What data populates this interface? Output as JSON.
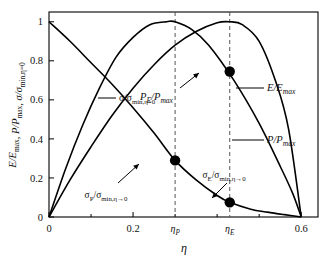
{
  "chart_data": {
    "type": "line",
    "title": "",
    "xlabel": "η",
    "ylabel": "E/E_max, P/P_max, σ/σ_min,η=0",
    "xlim": [
      0,
      0.64
    ],
    "ylim": [
      0,
      1.05
    ],
    "grid": false,
    "legend_position": "inline-labels",
    "x_ticks": [
      "0",
      "0.2",
      "ηP",
      "ηE",
      "0.6"
    ],
    "x_tick_values": [
      0,
      0.2,
      0.3,
      0.43,
      0.6
    ],
    "y_ticks": [
      "0",
      "0.2",
      "0.4",
      "0.6",
      "0.8",
      "1"
    ],
    "y_tick_values": [
      0,
      0.2,
      0.4,
      0.6,
      0.8,
      1
    ],
    "series": [
      {
        "name": "E/E_max",
        "peak_x": 0.43,
        "peak_y": 1.0,
        "zero_x": [
          0.0,
          0.6
        ],
        "x": [
          0.0,
          0.05,
          0.1,
          0.15,
          0.2,
          0.25,
          0.3,
          0.35,
          0.4,
          0.43,
          0.46,
          0.5,
          0.54,
          0.57,
          0.6
        ],
        "values": [
          0.0,
          0.19,
          0.36,
          0.52,
          0.66,
          0.78,
          0.88,
          0.95,
          0.995,
          1.0,
          0.985,
          0.9,
          0.69,
          0.45,
          0.0
        ]
      },
      {
        "name": "P/P_max",
        "peak_x": 0.3,
        "peak_y": 1.0,
        "zero_x": [
          0.0,
          0.6
        ],
        "x": [
          0.0,
          0.04,
          0.08,
          0.12,
          0.16,
          0.2,
          0.24,
          0.28,
          0.3,
          0.34,
          0.38,
          0.44,
          0.5,
          0.55,
          0.58,
          0.6
        ],
        "values": [
          0.0,
          0.25,
          0.47,
          0.66,
          0.82,
          0.92,
          0.985,
          1.0,
          1.0,
          0.96,
          0.88,
          0.7,
          0.48,
          0.26,
          0.12,
          0.0
        ]
      },
      {
        "name": "σ/σ_min,η=0",
        "monotonic": "decreasing",
        "x": [
          0.0,
          0.05,
          0.1,
          0.15,
          0.2,
          0.25,
          0.3,
          0.35,
          0.4,
          0.43,
          0.48,
          0.52,
          0.56,
          0.6
        ],
        "values": [
          1.0,
          0.9,
          0.79,
          0.68,
          0.56,
          0.43,
          0.29,
          0.19,
          0.11,
          0.075,
          0.04,
          0.025,
          0.012,
          0.0
        ]
      }
    ],
    "markers": [
      {
        "name": "sigma-at-etaP",
        "x": 0.3,
        "y": 0.29,
        "label": "σP/σmin,η→0"
      },
      {
        "name": "PE-at-etaE",
        "x": 0.43,
        "y": 0.745,
        "label": "PE/Pmax"
      },
      {
        "name": "sigmaE-at-etaE",
        "x": 0.43,
        "y": 0.075,
        "label": "σE/σmin,η→0"
      }
    ],
    "vertical_dashed_lines": [
      {
        "name": "etaP-line",
        "x": 0.3
      },
      {
        "name": "etaE-line",
        "x": 0.43
      }
    ]
  },
  "labels": {
    "y_axis": {
      "p1": "E/E",
      "p1sub": "max",
      "p1sep": ", ",
      "p2": "P/P",
      "p2sub": "max",
      "p2sep": ", ",
      "p3": "σ/σ",
      "p3sub": "min,η=0"
    },
    "x_axis": "η",
    "curve_sigma": {
      "base": "σ/σ",
      "sub": "min,η=0"
    },
    "curve_PE": {
      "base": "P",
      "basesub": "E",
      "rest": "/P",
      "restsub": "max"
    },
    "curve_E": {
      "base": "E/E",
      "sub": "max"
    },
    "curve_P": {
      "base": "P/P",
      "sub": "max"
    },
    "ann_sigmaP": {
      "base": "σ",
      "basesub": "P",
      "rest": "/σ",
      "restsub": "min,η→0"
    },
    "ann_sigmaE": {
      "base": "σ",
      "basesub": "E",
      "rest": "/σ",
      "restsub": "min,η→0"
    },
    "ticks_y": [
      "1",
      "0.8",
      "0.6",
      "0.4",
      "0.2",
      "0"
    ],
    "ticks_x": [
      "0",
      "0.2",
      "0.6"
    ],
    "tick_etaP": {
      "base": "η",
      "sub": "P"
    },
    "tick_etaE": {
      "base": "η",
      "sub": "E"
    }
  },
  "colors": {
    "curve": "#000000",
    "frame": "#000000",
    "dashed": "#555555",
    "background": "#ffffff",
    "marker": "#000000"
  }
}
